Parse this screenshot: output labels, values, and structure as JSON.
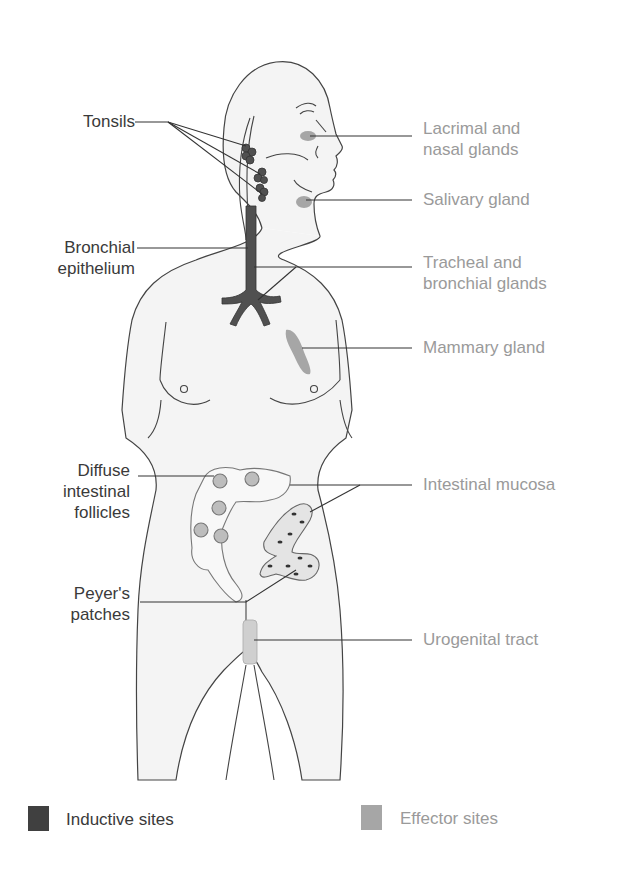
{
  "colors": {
    "inductive": "#404040",
    "effector": "#a6a6a6",
    "body_fill": "#f4f4f4",
    "outline": "#444444",
    "inductive_text": "#3a3a3a",
    "effector_text": "#9a9a9a"
  },
  "labels": {
    "inductive": [
      {
        "id": "tonsils",
        "lines": [
          "Tonsils"
        ]
      },
      {
        "id": "bronchial-epithelium",
        "lines": [
          "Bronchial",
          "epithelium"
        ]
      },
      {
        "id": "diffuse-intestinal-follicles",
        "lines": [
          "Diffuse",
          "intestinal",
          "follicles"
        ]
      },
      {
        "id": "peyers-patches",
        "lines": [
          "Peyer's",
          "patches"
        ]
      }
    ],
    "effector": [
      {
        "id": "lacrimal-nasal-glands",
        "lines": [
          "Lacrimal and",
          "nasal glands"
        ]
      },
      {
        "id": "salivary-gland",
        "lines": [
          "Salivary gland"
        ]
      },
      {
        "id": "tracheal-bronchial-glands",
        "lines": [
          "Tracheal and",
          "bronchial glands"
        ]
      },
      {
        "id": "mammary-gland",
        "lines": [
          "Mammary gland"
        ]
      },
      {
        "id": "intestinal-mucosa",
        "lines": [
          "Intestinal mucosa"
        ]
      },
      {
        "id": "urogenital-tract",
        "lines": [
          "Urogenital tract"
        ]
      }
    ]
  },
  "legend": {
    "inductive_label": "Inductive sites",
    "effector_label": "Effector sites"
  }
}
